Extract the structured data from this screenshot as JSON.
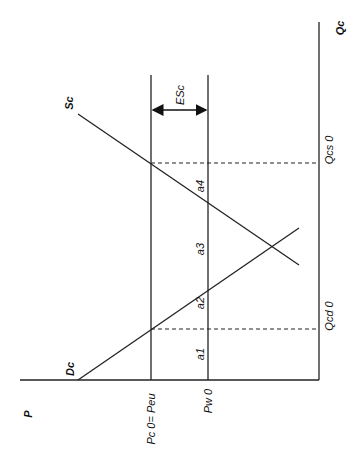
{
  "diagram": {
    "type": "rotated supply-demand diagram (price on horizontal, quantity on vertical, text rotated 90°)",
    "axes": {
      "price_axis_label": "P",
      "quantity_axis_label": "Qc"
    },
    "curves": {
      "supply_label": "Sc",
      "demand_label": "Dc"
    },
    "price_levels": {
      "high_price_label": "Pc 0= Peu",
      "world_price_label": "Pw 0"
    },
    "quantity_levels": {
      "supply_quantity_label": "Qcs 0",
      "demand_quantity_label": "Qcd 0"
    },
    "export_subsidy_label": "ESc",
    "areas": [
      "a1",
      "a2",
      "a3",
      "a4"
    ],
    "colors": {
      "ink": "#222222",
      "background": "#ffffff"
    }
  }
}
